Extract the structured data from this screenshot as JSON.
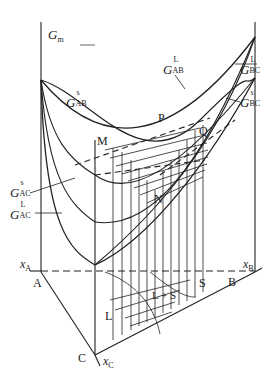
{
  "figure": {
    "type": "ternary-gibbs-free-energy-surface",
    "axis_label": {
      "symbol": "G",
      "subscript": "m"
    },
    "curves": [
      {
        "id": "G_AB_s",
        "symbol": "G",
        "superscript": "s",
        "subscript": "AB"
      },
      {
        "id": "G_AB_L",
        "symbol": "G",
        "superscript": "L",
        "subscript": "AB"
      },
      {
        "id": "G_BC_L",
        "symbol": "G",
        "superscript": "L",
        "subscript": "BC"
      },
      {
        "id": "G_BC_s",
        "symbol": "G",
        "superscript": "s",
        "subscript": "BC"
      },
      {
        "id": "G_AC_s",
        "symbol": "G",
        "superscript": "s",
        "subscript": "AC"
      },
      {
        "id": "G_AC_L",
        "symbol": "G",
        "superscript": "L",
        "subscript": "AC"
      }
    ],
    "points": {
      "M": "M",
      "N": "N",
      "P": "P",
      "Q": "Q"
    },
    "vertices": {
      "A": "A",
      "B": "B",
      "C": "C"
    },
    "composition_axes": {
      "xA": {
        "symbol": "x",
        "subscript": "A"
      },
      "xB": {
        "symbol": "x",
        "subscript": "B"
      },
      "xC": {
        "symbol": "x",
        "subscript": "C"
      }
    },
    "regions": {
      "liquid": "L",
      "two_phase": "L + S",
      "solid": "S"
    }
  }
}
